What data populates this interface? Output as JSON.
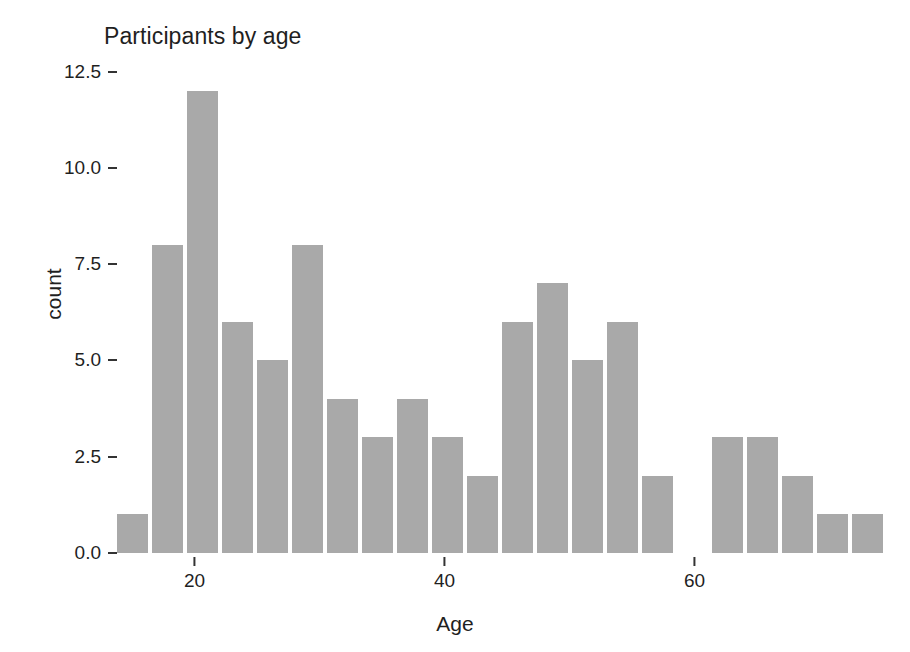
{
  "chart_data": {
    "type": "bar",
    "title": "Participants by age",
    "xlabel": "Age",
    "ylabel": "count",
    "grid": false,
    "legend": null,
    "xlim": [
      13.8,
      76.2
    ],
    "ylim": [
      0,
      12.8
    ],
    "xticks": [
      20,
      40,
      60
    ],
    "xtick_labels": [
      "20",
      "40",
      "60"
    ],
    "yticks": [
      0.0,
      2.5,
      5.0,
      7.5,
      10.0,
      12.5
    ],
    "ytick_labels": [
      "0.0",
      "2.5",
      "5.0",
      "7.5",
      "10.0",
      "12.5"
    ],
    "bin_width": 2.8,
    "bar_color": "#a9a9a9",
    "categories": [
      "15.2",
      "18.0",
      "20.8",
      "23.6",
      "26.4",
      "29.2",
      "32.0",
      "34.8",
      "37.6",
      "40.4",
      "43.2",
      "46.0",
      "48.8",
      "51.6",
      "54.4",
      "57.2",
      "60.0",
      "62.8",
      "65.6",
      "68.4",
      "71.2",
      "74.0",
      "76.8",
      "79.6",
      "82.4",
      "85.2",
      "88.0"
    ],
    "bins": [
      {
        "center": 15.2,
        "count": 1
      },
      {
        "center": 18.0,
        "count": 8
      },
      {
        "center": 20.8,
        "count": 12
      },
      {
        "center": 23.6,
        "count": 6
      },
      {
        "center": 26.4,
        "count": 5
      },
      {
        "center": 29.2,
        "count": 8
      },
      {
        "center": 32.0,
        "count": 4
      },
      {
        "center": 34.8,
        "count": 3
      },
      {
        "center": 37.6,
        "count": 4
      },
      {
        "center": 40.4,
        "count": 3
      },
      {
        "center": 43.2,
        "count": 2
      },
      {
        "center": 46.0,
        "count": 6
      },
      {
        "center": 48.8,
        "count": 7
      },
      {
        "center": 51.6,
        "count": 5
      },
      {
        "center": 54.4,
        "count": 6
      },
      {
        "center": 57.2,
        "count": 2
      },
      {
        "center": 60.0,
        "count": 0
      },
      {
        "center": 62.8,
        "count": 3
      },
      {
        "center": 65.6,
        "count": 3
      },
      {
        "center": 68.4,
        "count": 2
      },
      {
        "center": 71.2,
        "count": 1
      },
      {
        "center": 74.0,
        "count": 1
      },
      {
        "center": 76.8,
        "count": 0
      },
      {
        "center": 79.6,
        "count": 2
      },
      {
        "center": 82.4,
        "count": 1
      },
      {
        "center": 85.2,
        "count": 2
      },
      {
        "center": 88.0,
        "count": 1
      }
    ],
    "values": [
      1,
      8,
      12,
      6,
      5,
      8,
      4,
      3,
      4,
      3,
      2,
      6,
      7,
      5,
      6,
      2,
      0,
      3,
      3,
      2,
      1,
      1,
      0,
      2,
      1,
      2,
      1
    ],
    "total_count": 86
  }
}
